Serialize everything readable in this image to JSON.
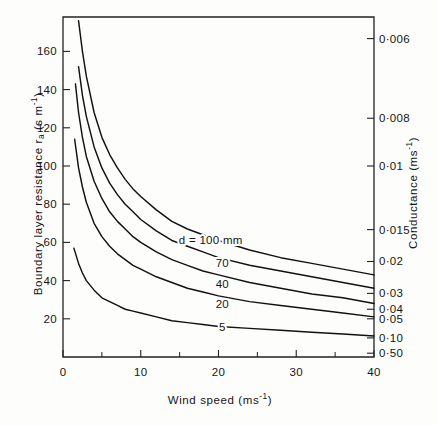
{
  "chart_data": {
    "type": "line",
    "title": "",
    "xlabel": "Wind speed (ms⁻¹)",
    "ylabel": "Boundary layer resistance rₐ (s m⁻¹)",
    "y2label": "Conductance (ms⁻¹)",
    "xlim": [
      0,
      40
    ],
    "ylim": [
      0,
      178
    ],
    "grid": false,
    "legend": "inline curve labels",
    "x_ticks_major": [
      0,
      10,
      20,
      30,
      40
    ],
    "x_tick_labels": [
      "0",
      "10",
      "20",
      "30",
      "40"
    ],
    "x_ticks_minor": [
      5,
      15,
      25,
      35
    ],
    "y_ticks_major": [
      20,
      40,
      60,
      80,
      100,
      120,
      140,
      160
    ],
    "y_tick_labels": [
      "20",
      "40",
      "60",
      "80",
      "100",
      "120",
      "140",
      "160"
    ],
    "y2_ticks_resistance": [
      166.7,
      125.0,
      100.0,
      66.7,
      50.0,
      33.3,
      25.0,
      20.0,
      10.0,
      2.0
    ],
    "y2_tick_labels": [
      "0·006",
      "0·008",
      "0·01",
      "0·015",
      "0·02",
      "0·03",
      "0·04",
      "0·05",
      "0·10",
      "0·50"
    ],
    "curve_color": "#111111",
    "axis_color": "#222222",
    "series": [
      {
        "name": "d = 100 mm",
        "label": "d = 100 mm",
        "label_x": 19.0,
        "label_y": 61.0,
        "x": [
          2.0,
          2.5,
          3,
          4,
          5,
          6,
          7,
          8,
          9,
          10,
          12,
          14,
          16,
          18,
          20,
          24,
          28,
          32,
          36,
          40
        ],
        "values": [
          176,
          160,
          147,
          128,
          115,
          106,
          99,
          93,
          88,
          84,
          77,
          71,
          67,
          64,
          61,
          56,
          52,
          49,
          46,
          43
        ]
      },
      {
        "name": "70",
        "label": "70",
        "label_x": 20.5,
        "label_y": 49.0,
        "x": [
          2.0,
          2.5,
          3,
          4,
          5,
          6,
          7,
          8,
          9,
          10,
          12,
          14,
          16,
          18,
          20,
          24,
          28,
          32,
          36,
          40
        ],
        "values": [
          152,
          137,
          126,
          110,
          99,
          91,
          85,
          80,
          76,
          72,
          66,
          61,
          58,
          55,
          52,
          48,
          45,
          42,
          39,
          36
        ]
      },
      {
        "name": "40",
        "label": "40",
        "label_x": 20.5,
        "label_y": 38.0,
        "x": [
          1.6,
          2,
          2.5,
          3,
          4,
          5,
          6,
          7,
          8,
          9,
          10,
          12,
          14,
          16,
          18,
          20,
          24,
          28,
          32,
          36,
          40
        ],
        "values": [
          143,
          128,
          115,
          105,
          92,
          83,
          76,
          71,
          67,
          63,
          60,
          55,
          51,
          48,
          45,
          43,
          39,
          36,
          33,
          31,
          28
        ]
      },
      {
        "name": "20",
        "label": "20",
        "label_x": 20.5,
        "label_y": 28.0,
        "x": [
          1.5,
          2,
          2.5,
          3,
          4,
          5,
          6,
          7,
          8,
          9,
          10,
          12,
          14,
          16,
          18,
          20,
          24,
          28,
          32,
          36,
          40
        ],
        "values": [
          114,
          99,
          89,
          81,
          70,
          63,
          58,
          54,
          51,
          48,
          46,
          42,
          39,
          36,
          34,
          32,
          29,
          27,
          25,
          23,
          21
        ]
      },
      {
        "name": "5",
        "label": "5",
        "label_x": 20.5,
        "label_y": 15.5,
        "x": [
          1.4,
          2,
          2.5,
          3,
          4,
          5,
          6,
          7,
          8,
          9,
          10,
          12,
          14,
          16,
          18,
          20,
          24,
          28,
          32,
          36,
          40
        ],
        "values": [
          57,
          49,
          44,
          40,
          35,
          31,
          29,
          27,
          25,
          24,
          23,
          21,
          19,
          18,
          17,
          16,
          15,
          14,
          13,
          12,
          11
        ]
      }
    ]
  },
  "axes": {
    "left_title_parts": {
      "main": "Boundary layer resistance r",
      "sub": "a",
      "units": " (s m",
      "exp": "-1",
      "close": ")"
    },
    "right_title_parts": {
      "main": "Conductance (ms",
      "exp": "-1",
      "close": ")"
    },
    "bottom_title_parts": {
      "main": "Wind speed (ms",
      "exp": "-1",
      "close": ")"
    }
  }
}
